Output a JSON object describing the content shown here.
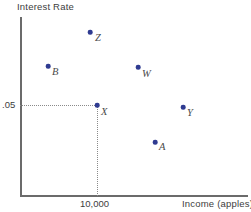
{
  "chart_data": {
    "type": "scatter",
    "title": "",
    "xlabel": "Income (apples)",
    "ylabel": "Interest Rate",
    "grid": false,
    "legend": null,
    "x_ticks": [
      "10,000"
    ],
    "y_ticks": [
      ".05"
    ],
    "guides": {
      "horizontal_at_y": ".05",
      "vertical_at_x": "10,000",
      "style": "dotted"
    },
    "point_color": "#2f3b91",
    "axis_color": "#6b6b6b",
    "points": [
      {
        "label": "Z",
        "x_px": 90,
        "y_px": 32,
        "lx_px": 95,
        "ly_px": 32
      },
      {
        "label": "B",
        "x_px": 48,
        "y_px": 66,
        "lx_px": 52,
        "ly_px": 66
      },
      {
        "label": "W",
        "x_px": 138,
        "y_px": 67,
        "lx_px": 142,
        "ly_px": 68
      },
      {
        "label": "X",
        "x_px": 97,
        "y_px": 105,
        "lx_px": 101,
        "ly_px": 106
      },
      {
        "label": "Y",
        "x_px": 183,
        "y_px": 107,
        "lx_px": 187,
        "ly_px": 107
      },
      {
        "label": "A",
        "x_px": 155,
        "y_px": 142,
        "lx_px": 159,
        "ly_px": 141
      }
    ]
  },
  "axes": {
    "y_title": "Interest Rate",
    "x_title": "Income (apples)",
    "y_tick_value": ".05",
    "x_tick_value": "10,000"
  },
  "labels": {
    "z": "Z",
    "b": "B",
    "w": "W",
    "x": "X",
    "y": "Y",
    "a": "A"
  }
}
